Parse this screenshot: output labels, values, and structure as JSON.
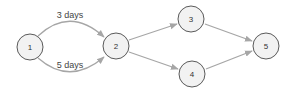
{
  "diagram": {
    "type": "directed-graph",
    "nodes": [
      {
        "id": "1",
        "label": "1",
        "x": 30,
        "y": 47
      },
      {
        "id": "2",
        "label": "2",
        "x": 116,
        "y": 46
      },
      {
        "id": "3",
        "label": "3",
        "x": 191,
        "y": 19
      },
      {
        "id": "4",
        "label": "4",
        "x": 192,
        "y": 74
      },
      {
        "id": "5",
        "label": "5",
        "x": 266,
        "y": 46
      }
    ],
    "edges": [
      {
        "from": "1",
        "to": "2",
        "label": "3 days",
        "curve": "upper"
      },
      {
        "from": "1",
        "to": "2",
        "label": "5 days",
        "curve": "lower"
      },
      {
        "from": "2",
        "to": "3",
        "label": ""
      },
      {
        "from": "2",
        "to": "4",
        "label": ""
      },
      {
        "from": "3",
        "to": "5",
        "label": ""
      },
      {
        "from": "4",
        "to": "5",
        "label": ""
      }
    ],
    "edge_labels": {
      "upper": "3 days",
      "lower": "5 days"
    },
    "colors": {
      "node_fill": "#f2f2f2",
      "node_stroke": "#5a5a5a",
      "edge": "#a6a6a6",
      "text": "#333333"
    }
  }
}
